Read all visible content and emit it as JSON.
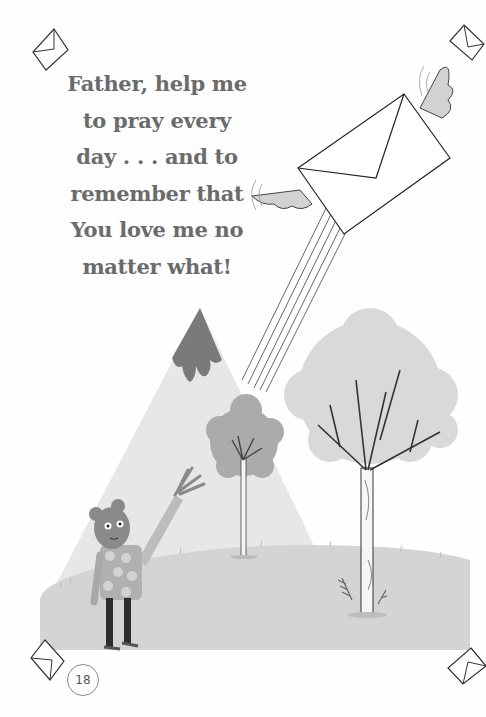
{
  "page": {
    "verse_lines": [
      "Father, help me",
      "to pray every",
      "day . . . and to",
      "remember that",
      "You love me no",
      "matter what!"
    ],
    "page_number": "18"
  },
  "illustration": {
    "elements": [
      "winged-envelope",
      "mountain",
      "small-tree",
      "large-tree",
      "bear-character-waving",
      "grassy-hill",
      "corner-envelope-icons"
    ]
  },
  "colors": {
    "text": "#6b6b6b",
    "background": "#fefefe",
    "ground": "#d3d3d3",
    "mountain": "#e6e6e6",
    "mountain_cap": "#7a7a7a",
    "tree_canopy_large": "#d8d8d8",
    "tree_canopy_small": "#aaaaaa"
  }
}
